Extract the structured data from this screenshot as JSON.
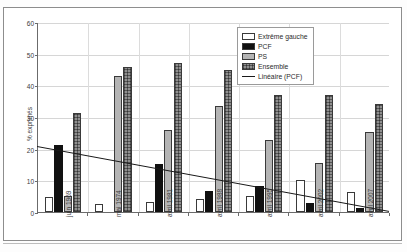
{
  "chart_data": {
    "type": "bar",
    "title": "",
    "xlabel": "",
    "ylabel": "% exprimés",
    "ylim": [
      0,
      60
    ],
    "yticks": [
      0,
      10,
      20,
      30,
      40,
      50,
      60
    ],
    "grid": true,
    "legend_position": "top-right",
    "categories": [
      "juin 1969",
      "mai 1974",
      "avril 1981",
      "avril 1988",
      "avril 1995",
      "avril 2002",
      "avril 2007"
    ],
    "series": [
      {
        "name": "Extrême gauche",
        "values": [
          4.8,
          2.5,
          3.3,
          4.2,
          4.9,
          10.0,
          6.3
        ]
      },
      {
        "name": "PCF",
        "values": [
          21.3,
          0,
          15.3,
          6.5,
          8.3,
          2.7,
          1.3
        ]
      },
      {
        "name": "PS",
        "values": [
          5.2,
          43.0,
          26.0,
          33.6,
          22.7,
          15.6,
          25.2
        ]
      },
      {
        "name": "Ensemble",
        "values": [
          31.3,
          45.8,
          46.9,
          44.8,
          36.8,
          37.0,
          34.0
        ]
      }
    ],
    "trendline": {
      "name": "Linéaire (PCF)",
      "start_value": 21.0,
      "end_value": 0.5
    }
  },
  "legend": {
    "items": [
      {
        "label": "Extrême gauche",
        "swatch": "white-fill"
      },
      {
        "label": "PCF",
        "swatch": "black-fill"
      },
      {
        "label": "PS",
        "swatch": "gray-fill"
      },
      {
        "label": "Ensemble",
        "swatch": "crosshatch-fill"
      },
      {
        "label": "Linéaire (PCF)",
        "swatch": "line"
      }
    ]
  },
  "colors": {
    "extreme_gauche": "#ffffff",
    "pcf": "#111111",
    "ps": "#b4b4b4",
    "ensemble": "#8f8f8f",
    "trendline": "#1a1a1a",
    "axis": "#6b6b6b",
    "grid": "#d6d6d6"
  }
}
